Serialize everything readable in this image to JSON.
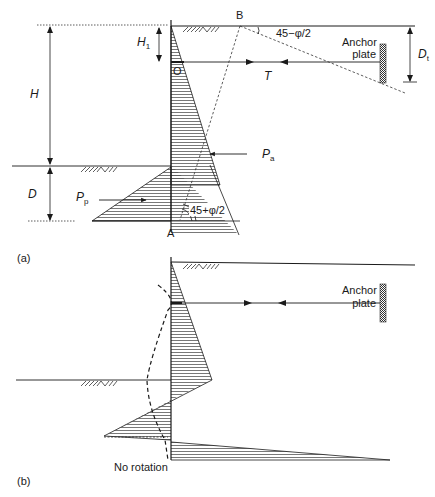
{
  "figure": {
    "panel_a": {
      "label": "(a)",
      "dimensions": {
        "H": "H",
        "H1": "H",
        "H1_sub": "1",
        "D": "D",
        "Dt": "D",
        "Dt_sub": "t"
      },
      "points": {
        "A": "A",
        "B": "B",
        "O": "O"
      },
      "forces": {
        "T": "T",
        "Pa": "P",
        "Pa_sub": "a",
        "Pp": "P",
        "Pp_sub": "p"
      },
      "angles": {
        "top": "45−φ/2",
        "bottom": "45+φ/2"
      },
      "anchor_label_line1": "Anchor",
      "anchor_label_line2": "plate"
    },
    "panel_b": {
      "label": "(b)",
      "anchor_label_line1": "Anchor",
      "anchor_label_line2": "plate",
      "note": "No rotation"
    },
    "colors": {
      "line": "#1a1a1a",
      "hatch": "#555555",
      "anchor_fill": "#777777"
    }
  }
}
